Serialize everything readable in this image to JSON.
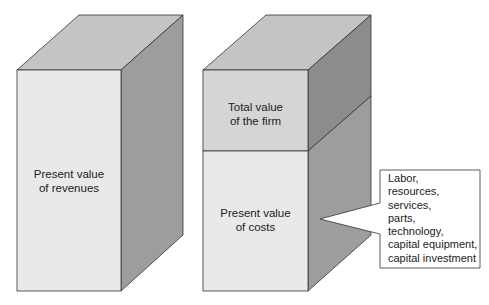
{
  "diagram": {
    "colors": {
      "front_light": "#e9e9e9",
      "front_firm": "#d5d5d5",
      "top": "#c4c4c4",
      "side_dark": "#8c8c8c",
      "side_light": "#9d9d9d",
      "edge": "#333333",
      "callout_bg": "#ffffff"
    },
    "left_block": {
      "label_lines": [
        "Present value",
        "of revenues"
      ]
    },
    "right_block": {
      "top_section": {
        "label_lines": [
          "Total value",
          "of the firm"
        ]
      },
      "bottom_section": {
        "label_lines": [
          "Present value",
          "of costs"
        ]
      }
    },
    "callout": {
      "lines": [
        "Labor,",
        "resources,",
        "services,",
        "parts,",
        "technology,",
        "capital equipment,",
        "capital investment"
      ]
    }
  }
}
